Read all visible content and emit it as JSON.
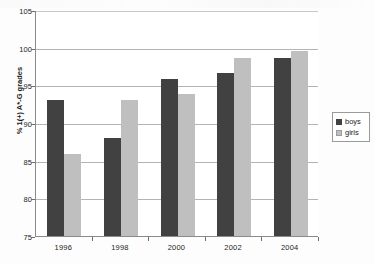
{
  "chart_data": {
    "type": "bar",
    "title": "",
    "subtitle": "",
    "xlabel": "",
    "ylabel": "% 1(+) A*-G grades",
    "categories": [
      "1996",
      "1998",
      "2000",
      "2002",
      "2004"
    ],
    "series": [
      {
        "name": "boys",
        "color": "#414141",
        "values": [
          93.0,
          88.0,
          95.8,
          96.7,
          98.6
        ]
      },
      {
        "name": "girls",
        "color": "#bfbfbf",
        "values": [
          85.9,
          93.0,
          93.9,
          98.7,
          99.6
        ]
      }
    ],
    "ylim": [
      75,
      105
    ],
    "yticks": [
      75,
      80,
      85,
      90,
      95,
      100,
      105
    ],
    "ytick_labels": [
      "75",
      "80",
      "85",
      "90",
      "95",
      "100",
      "105"
    ],
    "grid": true,
    "gridlines_at": [
      80,
      85,
      90,
      95,
      100
    ],
    "legend_position": "right",
    "legend_entries": [
      "boys",
      "girls"
    ]
  },
  "legend": {
    "items": [
      {
        "label": "boys"
      },
      {
        "label": "girls"
      }
    ]
  },
  "axes": {
    "y_title": "% 1(+) A*-G grades"
  },
  "colors": {
    "boys": "#414141",
    "girls": "#bfbfbf",
    "gridline": "#b4b4b4",
    "axis": "#8a8a8a",
    "text": "#1c1c1c",
    "plot_background": "#ffffff",
    "page_background": "#fdfdfd"
  }
}
